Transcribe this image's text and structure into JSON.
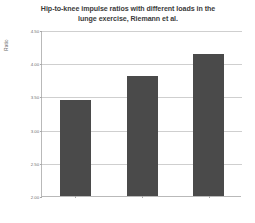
{
  "chart_data": {
    "type": "bar",
    "title": "Hip-to-knee impulse ratios with different loads in the lunge exercise, Riemann et al.",
    "title_line1": "Hip-to-knee impulse ratios with different loads in the",
    "title_line2": "lunge exercise, Riemann et al.",
    "xlabel": "",
    "ylabel": "Ratio",
    "categories": [
      "12.5% of bodyweight",
      "25% of bodyweight",
      "50% of bodyweight"
    ],
    "values": [
      3.44,
      3.8,
      4.14
    ],
    "ylim": [
      2.0,
      4.5
    ],
    "ytick_labels": [
      "4.50",
      "4.00",
      "3.50",
      "3.00",
      "2.50",
      "2.00"
    ],
    "ytick_values": [
      4.5,
      4.0,
      3.5,
      3.0,
      2.5,
      2.0
    ],
    "grid": true,
    "legend": "none",
    "bar_color": "#4a4a4a",
    "grid_color": "#cfcfcf",
    "axis_color": "#b9b9b9",
    "text_color": "#6f6f6f",
    "title_color": "#3b3b3b"
  }
}
